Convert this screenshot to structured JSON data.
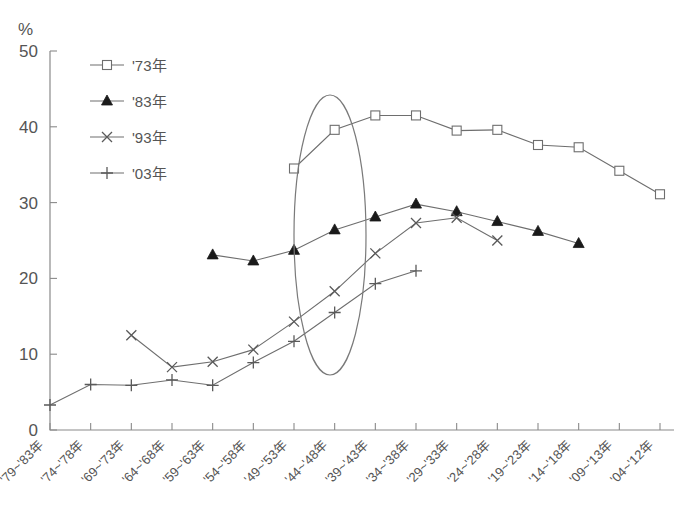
{
  "header": {
    "cropped_top_text": "",
    "y_axis_unit": "%"
  },
  "legend": {
    "items": [
      {
        "label": "'73年",
        "marker": "square-open-marker"
      },
      {
        "label": "'83年",
        "marker": "triangle-solid-marker"
      },
      {
        "label": "'93年",
        "marker": "x-cross-marker"
      },
      {
        "label": "'03年",
        "marker": "plus-cross-marker"
      }
    ]
  },
  "annotations": [
    {
      "name": "highlight-ellipse",
      "type": "ellipse",
      "cx": 330,
      "cy": 235,
      "rx": 36,
      "ry": 140
    }
  ],
  "chart_data": {
    "type": "line",
    "title": "",
    "xlabel": "",
    "ylabel": "%",
    "ylim": [
      0,
      50
    ],
    "yticks": [
      0,
      10,
      20,
      30,
      40,
      50
    ],
    "grid": false,
    "legend_position": "upper-left-inside",
    "categories": [
      "'79~'83年",
      "'74~'78年",
      "'69~'73年",
      "'64~'68年",
      "'59~'63年",
      "'54~'58年",
      "'49~'53年",
      "'44~'48年",
      "'39~'43年",
      "'34~'38年",
      "'29~'33年",
      "'24~'28年",
      "'19~'23年",
      "'14~'18年",
      "'09~'13年",
      "'04~'12年"
    ],
    "series": [
      {
        "name": "'73年",
        "marker": "square-open",
        "start_index": 6,
        "values": [
          null,
          null,
          null,
          null,
          null,
          null,
          34.5,
          39.6,
          41.5,
          41.5,
          39.5,
          39.6,
          37.6,
          37.3,
          34.2,
          31.1
        ]
      },
      {
        "name": "'83年",
        "marker": "triangle-solid",
        "start_index": 4,
        "values": [
          null,
          null,
          null,
          null,
          23.1,
          22.3,
          23.7,
          26.4,
          28.1,
          29.8,
          28.8,
          27.5,
          26.2,
          24.6,
          null,
          null
        ]
      },
      {
        "name": "'93年",
        "marker": "x-cross",
        "start_index": 2,
        "values": [
          null,
          null,
          12.5,
          8.3,
          9.0,
          10.6,
          14.3,
          18.3,
          23.3,
          27.3,
          28.0,
          25.0,
          null,
          null,
          null,
          null
        ]
      },
      {
        "name": "'03年",
        "marker": "plus-cross",
        "start_index": 0,
        "values": [
          3.3,
          6.0,
          5.9,
          6.6,
          5.9,
          8.9,
          11.7,
          15.5,
          19.3,
          21.0,
          null,
          null,
          null,
          null,
          null,
          null
        ]
      }
    ]
  }
}
